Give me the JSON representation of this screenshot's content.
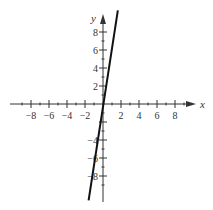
{
  "chart_data": {
    "type": "line",
    "title": "",
    "xlabel": "x",
    "ylabel": "y",
    "xlim": [
      -10,
      10
    ],
    "ylim": [
      -10,
      10
    ],
    "grid": false,
    "x_ticks": [
      -8,
      -6,
      -4,
      -2,
      2,
      4,
      6,
      8
    ],
    "y_ticks": [
      8,
      6,
      4,
      2,
      -4,
      -6,
      -8
    ],
    "x_tick_labels": [
      "−8",
      "−6",
      "−4",
      "−2",
      "2",
      "4",
      "6",
      "8"
    ],
    "y_tick_labels": [
      "8",
      "6",
      "4",
      "2",
      "−4",
      "−6",
      "−8"
    ],
    "series": [
      {
        "name": "y = 7x",
        "slope": 7,
        "intercept": 0,
        "x": [
          -1.6,
          1.65
        ],
        "y": [
          -10.7,
          10.4
        ],
        "color": "#111111"
      }
    ]
  },
  "colors": {
    "axis": "#333333",
    "line": "#111111"
  }
}
